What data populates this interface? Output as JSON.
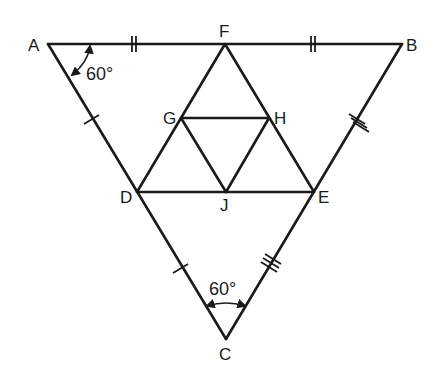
{
  "figure": {
    "stroke_color": "#1a1a1a",
    "background": "#ffffff"
  },
  "points": {
    "A": {
      "label": "A",
      "x": 48,
      "y": 44
    },
    "B": {
      "label": "B",
      "x": 402,
      "y": 44
    },
    "C": {
      "label": "C",
      "x": 226,
      "y": 339
    },
    "F": {
      "label": "F",
      "x": 225,
      "y": 44
    },
    "D": {
      "label": "D",
      "x": 137,
      "y": 192
    },
    "E": {
      "label": "E",
      "x": 314,
      "y": 192
    },
    "G": {
      "label": "G",
      "x": 181,
      "y": 118
    },
    "H": {
      "label": "H",
      "x": 269,
      "y": 118
    },
    "J": {
      "label": "J",
      "x": 226,
      "y": 192
    }
  },
  "segments": [
    [
      "A",
      "B"
    ],
    [
      "B",
      "C"
    ],
    [
      "C",
      "A"
    ],
    [
      "D",
      "E"
    ],
    [
      "E",
      "F"
    ],
    [
      "F",
      "D"
    ],
    [
      "G",
      "H"
    ],
    [
      "H",
      "J"
    ],
    [
      "J",
      "G"
    ]
  ],
  "tick_marks": {
    "AF": 2,
    "FB": 2,
    "AD": 1,
    "DC": 1,
    "BE": 3,
    "EC": 3
  },
  "angles": {
    "A": {
      "label": "60°"
    },
    "C": {
      "label": "60°"
    }
  }
}
